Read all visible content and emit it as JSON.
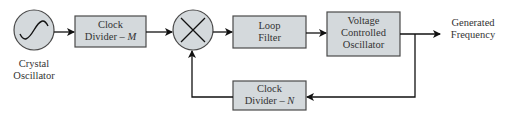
{
  "diagram": {
    "type": "block-diagram",
    "colors": {
      "block_fill": "#d4d9dc",
      "stroke": "#4a4a4a",
      "arrow": "#111111",
      "text": "#333333"
    },
    "nodes": [
      {
        "id": "crystal",
        "shape": "circle",
        "icon": "sine-wave-icon",
        "label_line1": "Crystal",
        "label_line2": "Oscillator"
      },
      {
        "id": "div_m",
        "shape": "rect",
        "label_line1": "Clock",
        "label_line2_prefix": "Divider – ",
        "label_line2_var": "M"
      },
      {
        "id": "mixer",
        "shape": "circle",
        "icon": "multiply-icon"
      },
      {
        "id": "loop_filter",
        "shape": "rect",
        "label_line1": "Loop",
        "label_line2": "Filter"
      },
      {
        "id": "vco",
        "shape": "rect",
        "label_line1": "Voltage",
        "label_line2": "Controlled",
        "label_line3": "Oscillator"
      },
      {
        "id": "div_n",
        "shape": "rect",
        "label_line1": "Clock",
        "label_line2_prefix": "Divider – ",
        "label_line2_var": "N"
      },
      {
        "id": "output",
        "shape": "text",
        "label_line1": "Generated",
        "label_line2": "Frequency"
      }
    ],
    "edges": [
      {
        "from": "crystal",
        "to": "div_m"
      },
      {
        "from": "div_m",
        "to": "mixer"
      },
      {
        "from": "mixer",
        "to": "loop_filter"
      },
      {
        "from": "loop_filter",
        "to": "vco"
      },
      {
        "from": "vco",
        "to": "output"
      },
      {
        "from": "vco",
        "to": "div_n"
      },
      {
        "from": "div_n",
        "to": "mixer"
      }
    ]
  }
}
